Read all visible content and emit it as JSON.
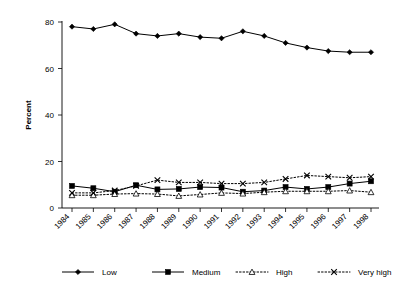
{
  "chart_data": {
    "type": "line",
    "title": "",
    "subtitle": "",
    "xlabel": "",
    "ylabel": "Percent",
    "categories": [
      "1984",
      "1985",
      "1986",
      "1987",
      "1988",
      "1989",
      "1990",
      "1991",
      "1992",
      "1993",
      "1994",
      "1995",
      "1996",
      "1997",
      "1998"
    ],
    "ylim": [
      0,
      80
    ],
    "ytick_values": [
      0,
      20,
      40,
      60,
      80
    ],
    "ytick_labels": [
      "0",
      "20",
      "40",
      "60",
      "80"
    ],
    "grid": false,
    "legend_position": "bottom",
    "series": [
      {
        "name": "Low",
        "marker": "filled-diamond",
        "line_style": "solid",
        "values": [
          78,
          77,
          79,
          75,
          74,
          75,
          73.5,
          73,
          76,
          74,
          71,
          69,
          67.5,
          67,
          67
        ]
      },
      {
        "name": "Medium",
        "marker": "filled-square",
        "line_style": "solid",
        "values": [
          9.5,
          8.5,
          7,
          9.8,
          8,
          8.2,
          9,
          8.8,
          7,
          7.5,
          9,
          8.2,
          9,
          10.5,
          11.5
        ]
      },
      {
        "name": "High",
        "marker": "open-triangle",
        "line_style": "dotted",
        "values": [
          5.5,
          5.5,
          6,
          6.2,
          6,
          5.2,
          5.8,
          6.5,
          6.2,
          6.8,
          7.2,
          7.2,
          7.2,
          7.5,
          6.8
        ]
      },
      {
        "name": "Very high",
        "marker": "cross-x",
        "line_style": "dotted",
        "values": [
          6.5,
          6.5,
          7.5,
          9.5,
          12,
          11,
          11,
          10.5,
          10.5,
          11,
          12.5,
          14,
          13.5,
          13,
          13.5
        ]
      }
    ]
  },
  "axes": {
    "y_title": "Percent",
    "y_ticks": [
      "0",
      "20",
      "40",
      "60",
      "80"
    ],
    "x_ticks": [
      "1984",
      "1985",
      "1986",
      "1987",
      "1988",
      "1989",
      "1990",
      "1991",
      "1992",
      "1993",
      "1994",
      "1995",
      "1996",
      "1997",
      "1998"
    ]
  },
  "legend": {
    "entries": [
      {
        "label": "Low",
        "marker": "filled-diamond",
        "line_style": "solid"
      },
      {
        "label": "Medium",
        "marker": "filled-square",
        "line_style": "solid"
      },
      {
        "label": "High",
        "marker": "open-triangle",
        "line_style": "dotted"
      },
      {
        "label": "Very high",
        "marker": "cross-x",
        "line_style": "dotted"
      }
    ]
  },
  "colors": {
    "ink": "#000000",
    "background": "#ffffff"
  }
}
